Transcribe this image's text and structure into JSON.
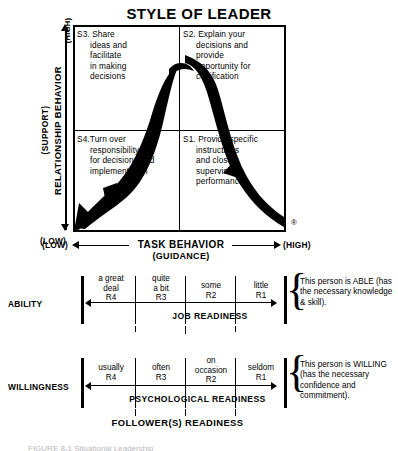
{
  "title": "STYLE OF LEADER",
  "grid": {
    "quadrants": [
      {
        "id": "S3",
        "code": "S3.",
        "line1": "Share",
        "lines": [
          "ideas and",
          "facilitate",
          "in making",
          "decisions"
        ]
      },
      {
        "id": "S2",
        "code": "S2.",
        "line1": "Explain your",
        "lines": [
          "decisions and",
          "provide",
          "opportunity for",
          "clarification"
        ]
      },
      {
        "id": "S4",
        "code": "S4.",
        "line1": "Turn over",
        "lines": [
          "responsibility",
          "for decisions and",
          "implementation"
        ]
      },
      {
        "id": "S1",
        "code": "S1.",
        "line1": "Provide specific",
        "lines": [
          "instructions",
          "and closely",
          "supervise",
          "performance"
        ]
      }
    ],
    "registered_mark": "®"
  },
  "y_axis": {
    "high": "(HIGH)",
    "low": "(LOW)",
    "label_top": "(SUPPORT)",
    "label_main": "RELATIONSHIP BEHAVIOR"
  },
  "x_axis": {
    "low": "(LOW)",
    "high": "(HIGH)",
    "label_main": "TASK BEHAVIOR",
    "label_sub": "(GUIDANCE)"
  },
  "ability": {
    "row_label": "ABILITY",
    "scale_title": "JOB READINESS",
    "cells": [
      {
        "text": "a great\ndeal",
        "level": "R4"
      },
      {
        "text": "quite\na bit",
        "level": "R3"
      },
      {
        "text": "some",
        "level": "R2"
      },
      {
        "text": "little",
        "level": "R1"
      }
    ],
    "cell_1_l1": "a great",
    "cell_1_l2": "deal",
    "cell_1_r": "R4",
    "cell_2_l1": "quite",
    "cell_2_l2": "a bit",
    "cell_2_r": "R3",
    "cell_3_l1": "some",
    "cell_3_r": "R2",
    "cell_4_l1": "little",
    "cell_4_r": "R1",
    "brace_glyph": "{",
    "brace_text": "This person is ABLE (has the necessary knowledge & skill)."
  },
  "willingness": {
    "row_label": "WILLINGNESS",
    "scale_title": "PSYCHOLOGICAL READINESS",
    "cells": [
      {
        "text": "usually",
        "level": "R4"
      },
      {
        "text": "often",
        "level": "R3"
      },
      {
        "text": "on\noccasion",
        "level": "R2"
      },
      {
        "text": "seldom",
        "level": "R1"
      }
    ],
    "cell_1_l1": "usually",
    "cell_1_r": "R4",
    "cell_2_l1": "often",
    "cell_2_r": "R3",
    "cell_3_l1": "on",
    "cell_3_l2": "occasion",
    "cell_3_r": "R2",
    "cell_4_l1": "seldom",
    "cell_4_r": "R1",
    "brace_glyph": "{",
    "brace_text": "This person is WILLING (has the necessary confidence and commitment)."
  },
  "followers_readiness_title": "FOLLOWER(S) READINESS",
  "caption": "FIGURE 8-1   Situational Leadership",
  "colors": {
    "ink": "#000000",
    "paper": "#ffffff",
    "caption_faded": "#b9b9b9"
  }
}
